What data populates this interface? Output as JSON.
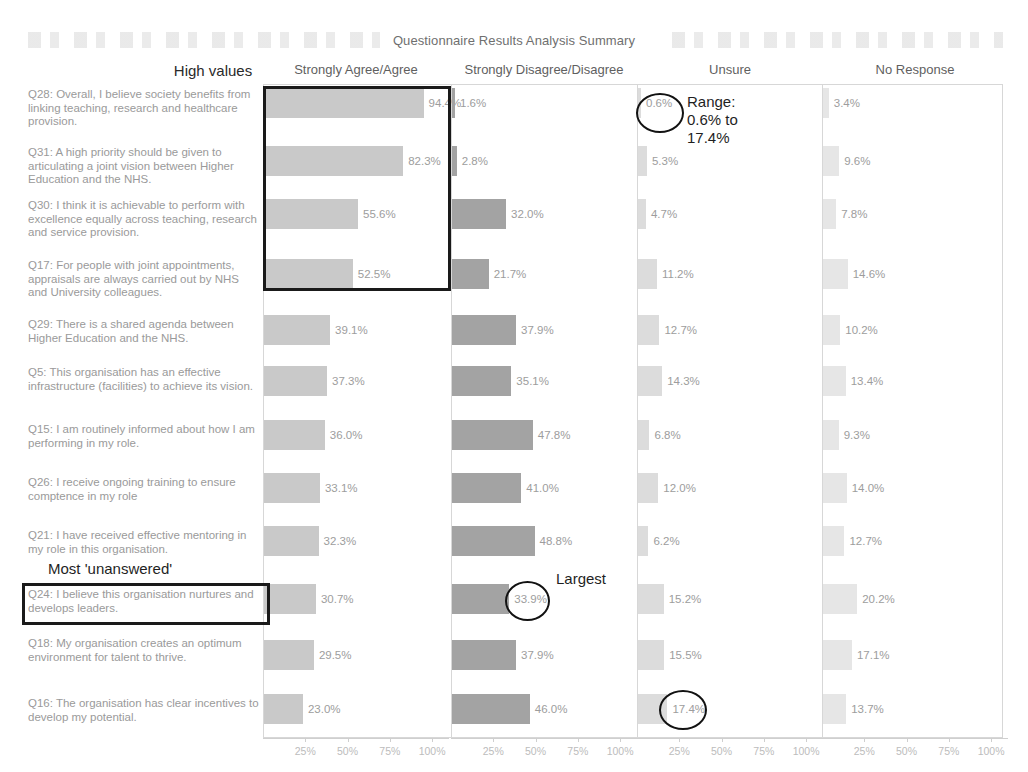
{
  "title": "Questionnaire Results Analysis Summary",
  "labels": {
    "high_values": "High values",
    "most_unanswered": "Most 'unanswered'",
    "largest": "Largest",
    "range": "Range:\n0.6% to\n17.4%"
  },
  "columns": [
    {
      "key": "agree",
      "header": "Strongly Agree/Agree"
    },
    {
      "key": "disagree",
      "header": "Strongly Disagree/Disagree"
    },
    {
      "key": "unsure",
      "header": "Unsure"
    },
    {
      "key": "noresponse",
      "header": "No Response"
    }
  ],
  "axis": {
    "ticks": [
      "25%",
      "50%",
      "75%",
      "100%"
    ],
    "tick_values": [
      25,
      50,
      75,
      100
    ],
    "max": 110
  },
  "chart_data": {
    "type": "bar",
    "title": "Questionnaire Results Analysis Summary",
    "xlabel": "",
    "ylabel": "",
    "xlim": [
      0,
      110
    ],
    "grid": false,
    "legend": "none",
    "orientation": "horizontal",
    "panels": [
      "Strongly Agree/Agree",
      "Strongly Disagree/Disagree",
      "Unsure",
      "No Response"
    ],
    "categories": [
      "Q28: Overall, I believe society benefits from linking teaching, research and healthcare provision.",
      "Q31: A high priority should be given to articulating a joint vision between Higher Education and the NHS.",
      "Q30: I think it is achievable to perform with excellence equally across teaching, research and service provision.",
      "Q17: For people with joint appointments, appraisals are always carried out by NHS and University colleagues.",
      "Q29: There is a shared agenda between Higher Education and the NHS.",
      "Q5: This organisation has an effective infrastructure (facilities) to achieve its vision.",
      "Q15: I am routinely informed about how I am performing in my role.",
      "Q26: I receive ongoing training to ensure comptence in my role",
      "Q21: I have received effective mentoring in my role in this organisation.",
      "Q24: I believe this organisation nurtures and develops leaders.",
      "Q18: My organisation creates an optimum environment for talent to thrive.",
      "Q16: The organisation has clear incentives to develop my potential."
    ],
    "series": [
      {
        "name": "Strongly Agree/Agree",
        "values": [
          94.4,
          82.3,
          55.6,
          52.5,
          39.1,
          37.3,
          36.0,
          33.1,
          32.3,
          30.7,
          29.5,
          23.0
        ]
      },
      {
        "name": "Strongly Disagree/Disagree",
        "values": [
          1.6,
          2.8,
          32.0,
          21.7,
          37.9,
          35.1,
          47.8,
          41.0,
          48.8,
          33.9,
          37.9,
          46.0
        ]
      },
      {
        "name": "Unsure",
        "values": [
          0.6,
          5.3,
          4.7,
          11.2,
          12.7,
          14.3,
          6.8,
          12.0,
          6.2,
          15.2,
          15.5,
          17.4
        ]
      },
      {
        "name": "No Response",
        "values": [
          3.4,
          9.6,
          7.8,
          14.6,
          10.2,
          13.4,
          9.3,
          14.0,
          12.7,
          20.2,
          17.1,
          13.7
        ]
      }
    ],
    "value_labels": {
      "agree": [
        "94.4%",
        "82.3%",
        "55.6%",
        "52.5%",
        "39.1%",
        "37.3%",
        "36.0%",
        "33.1%",
        "32.3%",
        "30.7%",
        "29.5%",
        "23.0%"
      ],
      "disagree": [
        "1.6%",
        "2.8%",
        "32.0%",
        "21.7%",
        "37.9%",
        "35.1%",
        "47.8%",
        "41.0%",
        "48.8%",
        "33.9%",
        "37.9%",
        "46.0%"
      ],
      "unsure": [
        "0.6%",
        "5.3%",
        "4.7%",
        "11.2%",
        "12.7%",
        "14.3%",
        "6.8%",
        "12.0%",
        "6.2%",
        "15.2%",
        "15.5%",
        "17.4%"
      ],
      "noresponse": [
        "3.4%",
        "9.6%",
        "7.8%",
        "14.6%",
        "10.2%",
        "13.4%",
        "9.3%",
        "14.0%",
        "12.7%",
        "20.2%",
        "17.1%",
        "13.7%"
      ]
    },
    "annotations": [
      {
        "name": "high-values-box",
        "text": "High values",
        "target": "Strongly Agree/Agree rows Q28-Q17"
      },
      {
        "name": "range-circle",
        "text": "Range:\n0.6% to\n17.4%",
        "target": "Unsure 0.6%"
      },
      {
        "name": "largest-circle",
        "text": "Largest",
        "target": "Strongly Disagree/Disagree 33.9%"
      },
      {
        "name": "unsure-max-circle",
        "text": "",
        "target": "Unsure 17.4%"
      },
      {
        "name": "most-unanswered-box",
        "text": "Most 'unanswered'",
        "target": "Q24 label"
      }
    ]
  },
  "colors": {
    "agree": "#c9c9c9",
    "disagree": "#a3a3a3",
    "unsure": "#dcdcdc",
    "noresponse": "#e6e6e6",
    "annotation": "#1a1a1a"
  }
}
